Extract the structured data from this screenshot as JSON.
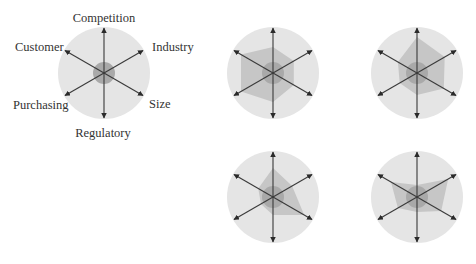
{
  "colors": {
    "outer_circle": "#e5e5e5",
    "polygon": "#c6c6c6",
    "inner_circle": "#a9a9a9",
    "arrow": "#3a3a3a",
    "label": "#333333"
  },
  "axes": [
    "Competition",
    "Industry",
    "Size",
    "Regulatory",
    "Purchasing",
    "Customer"
  ],
  "legend_diagram": {
    "cx": 104,
    "cy": 73,
    "outer_r": 46,
    "inner_r": 11,
    "arrow_len": 45,
    "labels": {
      "competition": "Competition",
      "industry": "Industry",
      "size": "Size",
      "regulatory": "Regulatory",
      "purchasing": "Purchasing",
      "customer": "Customer"
    }
  },
  "profiles": [
    {
      "name": "profile-1",
      "cx": 273,
      "cy": 73,
      "values": [
        26,
        24,
        24,
        29,
        37,
        37
      ]
    },
    {
      "name": "profile-2",
      "cx": 417,
      "cy": 73,
      "values": [
        36,
        32,
        31,
        22,
        20,
        22
      ]
    },
    {
      "name": "profile-3",
      "cx": 273,
      "cy": 197,
      "values": [
        29,
        22,
        36,
        18,
        14,
        17
      ]
    },
    {
      "name": "profile-4",
      "cx": 417,
      "cy": 197,
      "values": [
        12,
        36,
        28,
        15,
        22,
        30
      ]
    }
  ],
  "chart_data": {
    "type": "radar",
    "axes": [
      "Competition",
      "Industry",
      "Size",
      "Regulatory",
      "Purchasing",
      "Customer"
    ],
    "scale_max": 45,
    "series": [
      {
        "name": "Profile 1 (top-middle)",
        "values": [
          26,
          24,
          24,
          29,
          37,
          37
        ]
      },
      {
        "name": "Profile 2 (top-right)",
        "values": [
          36,
          32,
          31,
          22,
          20,
          22
        ]
      },
      {
        "name": "Profile 3 (bottom-middle)",
        "values": [
          29,
          22,
          36,
          18,
          14,
          17
        ]
      },
      {
        "name": "Profile 4 (bottom-right)",
        "values": [
          12,
          36,
          28,
          15,
          22,
          30
        ]
      }
    ]
  }
}
